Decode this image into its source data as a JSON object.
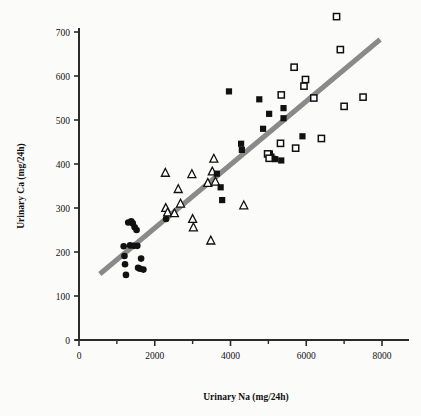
{
  "chart_data": {
    "type": "scatter",
    "title": "",
    "xlabel": "Urinary Na (mg/24h)",
    "ylabel": "Urinary Ca (mg/24h)",
    "xlim": [
      0,
      8700
    ],
    "ylim": [
      0,
      740
    ],
    "x_ticks_major": [
      0,
      2000,
      4000,
      6000,
      8000
    ],
    "x_ticks_minor": [
      1000,
      3000,
      5000,
      7000
    ],
    "x_tick_labels": [
      "0",
      "2000",
      "4000",
      "6000",
      "8000"
    ],
    "y_ticks_major": [
      0,
      100,
      200,
      300,
      400,
      500,
      600,
      700
    ],
    "y_tick_labels": [
      "0",
      "100",
      "200",
      "300",
      "400",
      "500",
      "600",
      "700"
    ],
    "grid": false,
    "legend": "none",
    "series": [
      {
        "name": "group-1-filled-circle",
        "marker": "filled-circle",
        "color": "#111111",
        "points": [
          [
            1180,
            213
          ],
          [
            1200,
            191
          ],
          [
            1215,
            172
          ],
          [
            1240,
            148
          ],
          [
            1300,
            267
          ],
          [
            1350,
            215
          ],
          [
            1380,
            270
          ],
          [
            1420,
            265
          ],
          [
            1450,
            214
          ],
          [
            1470,
            256
          ],
          [
            1520,
            250
          ],
          [
            1540,
            214
          ],
          [
            1560,
            164
          ],
          [
            1610,
            162
          ],
          [
            1640,
            185
          ],
          [
            1700,
            160
          ],
          [
            2300,
            275
          ]
        ]
      },
      {
        "name": "group-2-open-triangle",
        "marker": "open-triangle",
        "color": "#111111",
        "points": [
          [
            2280,
            380
          ],
          [
            2290,
            300
          ],
          [
            2340,
            290
          ],
          [
            2520,
            288
          ],
          [
            2620,
            343
          ],
          [
            2680,
            310
          ],
          [
            2980,
            377
          ],
          [
            3000,
            275
          ],
          [
            3020,
            256
          ],
          [
            3400,
            357
          ],
          [
            3480,
            226
          ],
          [
            3520,
            383
          ],
          [
            3560,
            412
          ],
          [
            3600,
            360
          ],
          [
            4350,
            306
          ]
        ]
      },
      {
        "name": "group-3-filled-square",
        "marker": "filled-square",
        "color": "#111111",
        "points": [
          [
            3640,
            378
          ],
          [
            3740,
            347
          ],
          [
            3780,
            318
          ],
          [
            3960,
            565
          ],
          [
            4280,
            446
          ],
          [
            4300,
            432
          ],
          [
            4760,
            547
          ],
          [
            4860,
            480
          ],
          [
            5020,
            514
          ],
          [
            5040,
            424
          ],
          [
            5080,
            417
          ],
          [
            5120,
            412
          ],
          [
            5180,
            411
          ],
          [
            5340,
            408
          ],
          [
            5400,
            527
          ],
          [
            5400,
            504
          ],
          [
            5900,
            463
          ]
        ]
      },
      {
        "name": "group-4-open-square",
        "marker": "open-square",
        "color": "#111111",
        "points": [
          [
            4980,
            423
          ],
          [
            5020,
            413
          ],
          [
            5320,
            447
          ],
          [
            5340,
            557
          ],
          [
            5680,
            620
          ],
          [
            5720,
            436
          ],
          [
            5940,
            577
          ],
          [
            5980,
            592
          ],
          [
            6200,
            550
          ],
          [
            6400,
            458
          ],
          [
            6800,
            735
          ],
          [
            6900,
            660
          ],
          [
            7000,
            531
          ],
          [
            7500,
            552
          ]
        ]
      }
    ],
    "trendline": {
      "name": "regression-line",
      "color": "#8a8a8a",
      "x_start": 550,
      "y_start": 150,
      "x_end": 7950,
      "y_end": 683,
      "width": 5
    }
  },
  "plot_geometry": {
    "origin_x_px": 79,
    "origin_y_px": 340,
    "x_span_px": 303,
    "x_span_units": 8000,
    "y_span_px": 308,
    "y_span_units": 700
  }
}
